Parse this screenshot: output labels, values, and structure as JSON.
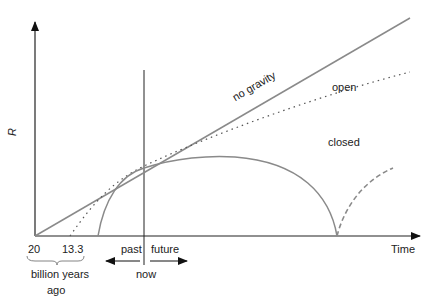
{
  "diagram": {
    "y_axis_label": "R",
    "x_axis_label": "Time",
    "curves": [
      {
        "name": "no gravity",
        "style": "solid"
      },
      {
        "name": "open",
        "style": "dotted"
      },
      {
        "name": "closed",
        "style": "solid"
      }
    ],
    "ticks": [
      "20",
      "13.3"
    ],
    "tick_group_label_line1": "billion years",
    "tick_group_label_line2": "ago",
    "now_label": "now",
    "past_label": "past",
    "future_label": "future",
    "colors": {
      "curve": "#8a8a8a",
      "axis": "#222222",
      "dotted": "#555555"
    }
  }
}
